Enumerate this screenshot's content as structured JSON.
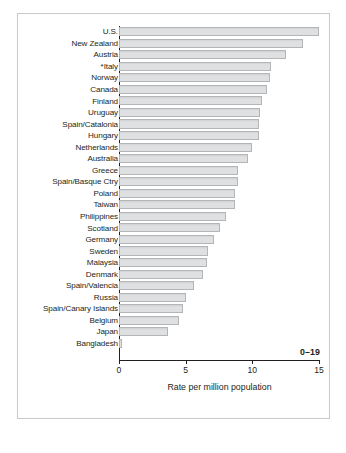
{
  "chart_data": {
    "type": "bar",
    "orientation": "horizontal",
    "title": "",
    "xlabel": "Rate per million population",
    "ylabel": "",
    "xlim": [
      0,
      15
    ],
    "xticks": [
      "0",
      "5",
      "10",
      "15"
    ],
    "xtick_values": [
      0,
      5,
      10,
      15
    ],
    "grid": false,
    "legend": null,
    "annotation": "0–19",
    "categories": [
      "U.S.",
      "New Zealand",
      "Austria",
      "*Italy",
      "Norway",
      "Canada",
      "Finland",
      "Uruguay",
      "Spain/Catalonia",
      "Hungary",
      "Netherlands",
      "Australia",
      "Greece",
      "Spain/Basque Ctry",
      "Poland",
      "Taiwan",
      "Philippines",
      "Scotland",
      "Germany",
      "Sweden",
      "Malaysia",
      "Denmark",
      "Spain/Valencia",
      "Russia",
      "Spain/Canary Islands",
      "Belgium",
      "Japan",
      "Bangladesh"
    ],
    "values": [
      15.0,
      13.8,
      12.5,
      11.4,
      11.3,
      11.1,
      10.7,
      10.6,
      10.5,
      10.5,
      10.0,
      9.7,
      8.9,
      8.9,
      8.7,
      8.7,
      8.0,
      7.6,
      7.1,
      6.7,
      6.6,
      6.3,
      5.6,
      5.0,
      4.8,
      4.5,
      3.7,
      0.2
    ],
    "bar_fill_color": "#dfe0e1",
    "bar_border_color": "#b4b5b7",
    "axis_color": "#231f20"
  },
  "figure": {
    "caption": ""
  }
}
